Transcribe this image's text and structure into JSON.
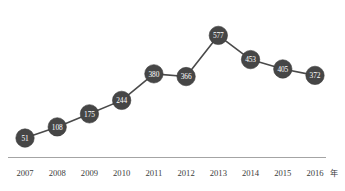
{
  "chart_data": {
    "type": "line",
    "title": "",
    "subtitle": "",
    "xlabel": "",
    "ylabel": "",
    "axis_unit": "年",
    "categories": [
      "2007",
      "2008",
      "2009",
      "2010",
      "2011",
      "2012",
      "2013",
      "2014",
      "2015",
      "2016"
    ],
    "values": [
      51,
      108,
      175,
      244,
      380,
      366,
      577,
      453,
      405,
      372
    ],
    "point_labels": [
      "51",
      "108",
      "175",
      "244",
      "380",
      "366",
      "577",
      "453",
      "405",
      "372"
    ],
    "series": [
      {
        "name": "",
        "values": [
          51,
          108,
          175,
          244,
          380,
          366,
          577,
          453,
          405,
          372
        ]
      }
    ],
    "ylim": [
      0,
      620
    ],
    "xlim_labels": [
      "2007",
      "2016"
    ],
    "grid": false,
    "legend": false,
    "legend_position": "none",
    "show_data_labels": true,
    "marker": "circle",
    "colors": {
      "marker_fill": "#464646",
      "marker_label": "#ffffff",
      "line": "#4a4a4a",
      "axis": "#9a9a9a",
      "tick_label": "#3b3b3b",
      "background": "#ffffff"
    }
  }
}
